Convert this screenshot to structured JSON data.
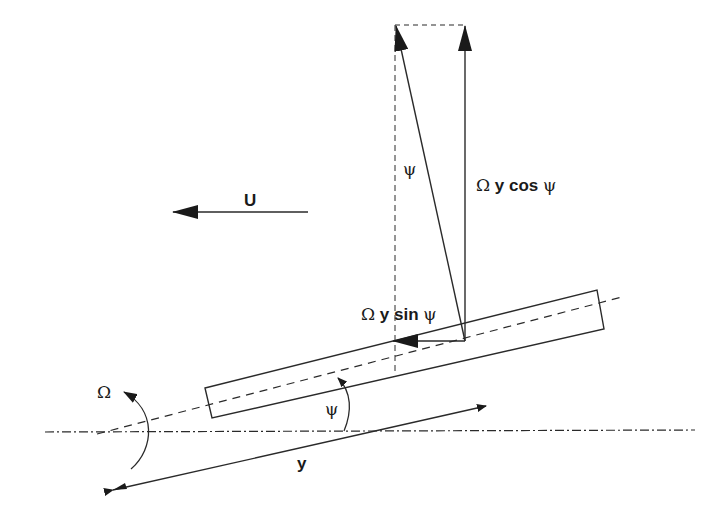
{
  "diagram": {
    "type": "velocity-decomposition",
    "labels": {
      "freestream": "U",
      "omega": "Ω",
      "psi_blade": "ψ",
      "psi_vector": "ψ",
      "radial": "y",
      "cos_component": {
        "omega": "Ω",
        "text": " y cos ",
        "psi": "ψ"
      },
      "sin_component": {
        "omega": "Ω",
        "text": " y sin ",
        "psi": "ψ"
      }
    },
    "colors": {
      "stroke": "#2a2a2a",
      "text": "#1a1a1a",
      "background": "#ffffff"
    }
  }
}
